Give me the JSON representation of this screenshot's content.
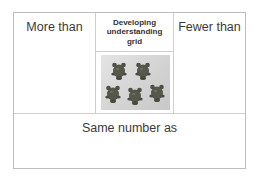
{
  "grid": {
    "top_left_label": "More than",
    "top_middle_header": [
      "Developing",
      "understanding",
      "grid"
    ],
    "top_right_label": "Fewer than",
    "bottom_label": "Same number as",
    "image": {
      "description": "photo of five small toy bear/owl counters",
      "count": 5
    }
  },
  "colors": {
    "border": "#bdbdbd",
    "inner_border": "#cfcfcf",
    "text": "#333333",
    "photo_bg": "#d6d6d6",
    "counter": "#5a5a4a"
  }
}
